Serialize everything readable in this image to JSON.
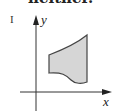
{
  "caption": {
    "partial_text": "neither."
  },
  "figure": {
    "panel_label": "I",
    "axes": {
      "x_label": "x",
      "y_label": "y"
    },
    "region": {
      "fill": "#d6d6d6",
      "stroke": "#444444",
      "description": "shaded region with straight left and right vertical edges, curved top boundary, wavy bottom boundary"
    }
  }
}
